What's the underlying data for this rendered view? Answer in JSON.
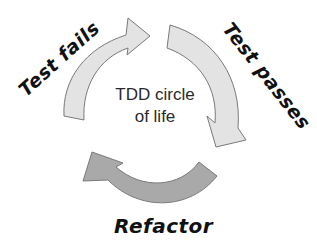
{
  "diagram": {
    "title": "TDD circle of life",
    "center_label_line1": "TDD circle",
    "center_label_line2": "of life",
    "stages": [
      {
        "label": "Test fails",
        "position": "top-left",
        "arrow_color": "#e3e3e3"
      },
      {
        "label": "Test passes",
        "position": "right",
        "arrow_color": "#e3e3e3"
      },
      {
        "label": "Refactor",
        "position": "bottom",
        "arrow_color": "#a9a9a9"
      }
    ],
    "colors": {
      "arrow_light": "#e3e3e3",
      "arrow_dark": "#a9a9a9",
      "arrow_stroke": "#7a7a7a",
      "text": "#111111",
      "background": "#ffffff"
    }
  }
}
